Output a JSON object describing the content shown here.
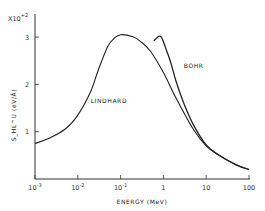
{
  "chart_data": {
    "type": "line",
    "title": "",
    "xlabel": "ENERGY (MeV)",
    "ylabel": "S_HL^U (eV/Å)",
    "y_scale_note": "x10^+2",
    "xscale": "log",
    "xlim": [
      0.001,
      100
    ],
    "ylim": [
      0,
      3.3
    ],
    "x_ticks": [
      {
        "base": "10",
        "exp": "-3",
        "value": 0.001
      },
      {
        "base": "10",
        "exp": "-2",
        "value": 0.01
      },
      {
        "base": "10",
        "exp": "-1",
        "value": 0.1
      },
      {
        "base": "1",
        "exp": "",
        "value": 1
      },
      {
        "base": "10",
        "exp": "",
        "value": 10
      },
      {
        "base": "100",
        "exp": "",
        "value": 100
      }
    ],
    "y_ticks": [
      {
        "label": "1",
        "value": 1
      },
      {
        "label": "2",
        "value": 2
      },
      {
        "label": "3",
        "value": 3
      }
    ],
    "grid": false,
    "series": [
      {
        "name": "LINDHARD",
        "x": [
          0.001,
          0.002,
          0.005,
          0.01,
          0.02,
          0.03,
          0.05,
          0.07,
          0.1,
          0.2,
          0.3,
          0.5,
          1,
          2,
          5,
          10,
          20,
          50,
          100
        ],
        "y": [
          0.75,
          0.85,
          1.05,
          1.35,
          1.85,
          2.3,
          2.8,
          2.97,
          3.05,
          3.0,
          2.9,
          2.7,
          2.25,
          1.7,
          1.05,
          0.7,
          0.5,
          0.3,
          0.2
        ]
      },
      {
        "name": "BOHR",
        "x": [
          0.6,
          0.7,
          0.8,
          0.9,
          1,
          1.2,
          1.5,
          2,
          3,
          5,
          10,
          20,
          50,
          100
        ],
        "y": [
          2.92,
          2.98,
          3.02,
          3.0,
          2.9,
          2.7,
          2.45,
          2.05,
          1.6,
          1.15,
          0.72,
          0.5,
          0.3,
          0.2
        ]
      }
    ],
    "annotations": [
      {
        "text": "LINDHARD",
        "x": 0.02,
        "y": 1.6
      },
      {
        "text": "BOHR",
        "x": 3,
        "y": 2.35
      }
    ]
  },
  "labels": {
    "y_multiplier_base": "X10",
    "y_multiplier_exp": "+2",
    "ylabel": "S_HL^U (eV/Å)",
    "xlabel": "ENERGY (MeV)",
    "lindhard": "LINDHARD",
    "bohr": "BOHR"
  }
}
